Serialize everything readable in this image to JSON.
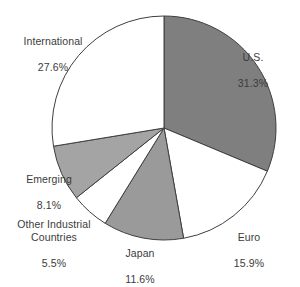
{
  "chart_data": {
    "type": "pie",
    "title": "",
    "subtitle": "",
    "xlabel": "",
    "ylabel": "",
    "legend_position": "none",
    "grid": false,
    "value_unit": "percent",
    "categories": [
      "U.S.",
      "Euro",
      "Japan",
      "Other Industrial Countries",
      "Emerging",
      "International"
    ],
    "values": [
      31.3,
      15.9,
      11.6,
      5.5,
      8.1,
      27.6
    ],
    "slices": [
      {
        "name": "U.S.",
        "value": 31.3,
        "value_label": "31.3%",
        "fill": "#7f7f7f",
        "stroke": "#3f3f3f",
        "start_angle": 0,
        "end_angle": 112.68
      },
      {
        "name": "Euro",
        "value": 15.9,
        "value_label": "15.9%",
        "fill": "#ffffff",
        "stroke": "#3f3f3f",
        "start_angle": 112.68,
        "end_angle": 169.92
      },
      {
        "name": "Japan",
        "value": 11.6,
        "value_label": "11.6%",
        "fill": "#9a9a9a",
        "stroke": "#3f3f3f",
        "start_angle": 169.92,
        "end_angle": 211.68
      },
      {
        "name": "Other Industrial Countries",
        "value": 5.5,
        "value_label": "5.5%",
        "fill": "#ffffff",
        "stroke": "#3f3f3f",
        "start_angle": 211.68,
        "end_angle": 231.48
      },
      {
        "name": "Emerging",
        "value": 8.1,
        "value_label": "8.1%",
        "fill": "#a4a4a4",
        "stroke": "#3f3f3f",
        "start_angle": 231.48,
        "end_angle": 260.64
      },
      {
        "name": "International",
        "value": 27.6,
        "value_label": "27.6%",
        "fill": "#ffffff",
        "stroke": "#3f3f3f",
        "start_angle": 260.64,
        "end_angle": 360
      }
    ]
  },
  "labels": {
    "international": {
      "name": "International",
      "value": "27.6%"
    },
    "us": {
      "name": "U.S.",
      "value": "31.3%"
    },
    "euro": {
      "name": "Euro",
      "value": "15.9%"
    },
    "japan": {
      "name": "Japan",
      "value": "11.6%"
    },
    "other": {
      "name": "Other Industrial\nCountries",
      "value": "5.5%"
    },
    "emerging": {
      "name": "Emerging",
      "value": "8.1%"
    }
  },
  "geometry": {
    "center_x": 164,
    "center_y": 128,
    "radius": 112
  }
}
